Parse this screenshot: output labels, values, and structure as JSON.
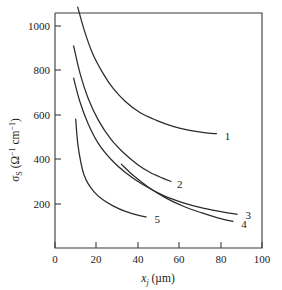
{
  "chart_data": {
    "type": "line",
    "title": "",
    "xlabel": "x_j (µm)",
    "ylabel": "σ_S (Ω⁻¹ cm⁻¹)",
    "xlim": [
      0,
      100
    ],
    "ylim": [
      0,
      1100
    ],
    "grid": false,
    "legend": "inline-end-labels",
    "xticks": [
      0,
      20,
      40,
      60,
      80,
      100
    ],
    "yticks": [
      200,
      400,
      600,
      800,
      1000
    ],
    "xtick_labels": [
      "0",
      "20",
      "40",
      "60",
      "80",
      "100"
    ],
    "ytick_labels": [
      "200",
      "400",
      "600",
      "800",
      "1000"
    ],
    "series": [
      {
        "name": "1",
        "label": "1",
        "x": [
          11,
          14,
          18,
          23,
          28,
          34,
          41,
          49,
          57,
          65,
          72,
          78
        ],
        "y": [
          1085,
          985,
          880,
          790,
          720,
          660,
          610,
          575,
          548,
          530,
          520,
          515
        ]
      },
      {
        "name": "2",
        "label": "2",
        "x": [
          9,
          12,
          16,
          21,
          27,
          33,
          40,
          46,
          52,
          56
        ],
        "y": [
          910,
          790,
          675,
          575,
          490,
          430,
          375,
          340,
          315,
          300
        ]
      },
      {
        "name": "3",
        "label": "3",
        "x": [
          9,
          12,
          16,
          21,
          27,
          34,
          42,
          52,
          62,
          72,
          82,
          88
        ],
        "y": [
          765,
          660,
          560,
          470,
          400,
          340,
          288,
          238,
          203,
          178,
          160,
          152
        ]
      },
      {
        "name": "4",
        "label": "4",
        "x": [
          32,
          38,
          45,
          53,
          62,
          71,
          79,
          86
        ],
        "y": [
          378,
          325,
          275,
          228,
          188,
          158,
          135,
          120
        ]
      },
      {
        "name": "5",
        "label": "5",
        "x": [
          10,
          11,
          12.5,
          14,
          16,
          19,
          23,
          28,
          34,
          40,
          44
        ],
        "y": [
          580,
          470,
          385,
          330,
          290,
          252,
          218,
          190,
          165,
          148,
          140
        ]
      }
    ],
    "series_label_positions": [
      {
        "name": "1",
        "x": 82,
        "y": 505
      },
      {
        "name": "2",
        "x": 59,
        "y": 288
      },
      {
        "name": "3",
        "x": 92,
        "y": 148
      },
      {
        "name": "4",
        "x": 90,
        "y": 108
      },
      {
        "name": "5",
        "x": 48,
        "y": 130
      }
    ],
    "colors": {
      "curve": "#2b2b2b",
      "axis": "#3a3a3a",
      "background": "#ffffff",
      "text": "#1a1a1a"
    }
  },
  "axis_text": {
    "y_sigma": "σ",
    "y_sigma_sub": "S",
    "y_open": " (Ω",
    "y_sup1": "−1",
    "y_cm": " cm",
    "y_sup2": "−1",
    "y_close": ")",
    "x_var": "x",
    "x_var_sub": "j",
    "x_unit": " (µm)"
  }
}
